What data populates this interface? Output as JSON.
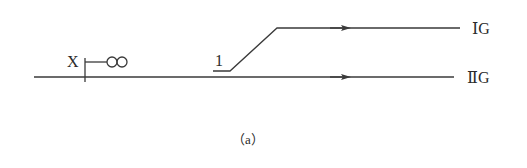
{
  "diagram": {
    "caption": "（a）",
    "signal": {
      "label": "X"
    },
    "switch": {
      "label": "1"
    },
    "tracks": [
      {
        "id": "upper",
        "label": "ⅠG"
      },
      {
        "id": "lower",
        "label": "ⅡG"
      }
    ],
    "colors": {
      "line": "#3a3a3a",
      "text": "#2a2a2a",
      "background": "#ffffff"
    }
  }
}
